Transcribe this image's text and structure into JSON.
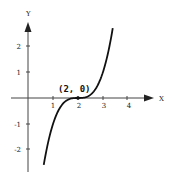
{
  "chart_data": {
    "type": "line",
    "function": "y = (x - 2)^3",
    "title": "",
    "xlabel": "X",
    "ylabel": "Y",
    "xlim": [
      -1,
      5.7
    ],
    "ylim": [
      -2.9,
      3.4
    ],
    "grid": false,
    "x_ticks": [
      "1",
      "2",
      "3",
      "4"
    ],
    "y_ticks": [
      "2",
      "1",
      "-1",
      "-2"
    ],
    "annotation": {
      "text": "(2, 0)",
      "x": 2,
      "y": 0
    },
    "series": [
      {
        "name": "y = (x-2)^3",
        "x": [
          0.63,
          0.8,
          1.0,
          1.2,
          1.4,
          1.6,
          1.8,
          2.0,
          2.2,
          2.4,
          2.6,
          2.8,
          3.0,
          3.2,
          3.39
        ],
        "y": [
          -2.57,
          -1.73,
          -1.0,
          -0.51,
          -0.22,
          -0.06,
          -0.01,
          0,
          0.01,
          0.06,
          0.22,
          0.51,
          1.0,
          1.73,
          2.69
        ]
      }
    ]
  }
}
